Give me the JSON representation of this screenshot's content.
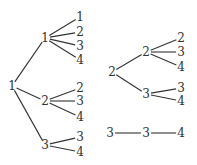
{
  "top_text": "",
  "trees": [
    {
      "label": "1",
      "pos": [
        12,
        86
      ],
      "children": [
        {
          "label": "1",
          "pos": [
            45,
            38
          ],
          "leaves": [
            {
              "label": "1",
              "pos": [
                80,
                17
              ]
            },
            {
              "label": "2",
              "pos": [
                80,
                32
              ]
            },
            {
              "label": "3",
              "pos": [
                80,
                46
              ]
            },
            {
              "label": "4",
              "pos": [
                80,
                60
              ]
            }
          ]
        },
        {
          "label": "2",
          "pos": [
            45,
            101
          ],
          "leaves": [
            {
              "label": "2",
              "pos": [
                80,
                88
              ]
            },
            {
              "label": "3",
              "pos": [
                80,
                101
              ]
            },
            {
              "label": "4",
              "pos": [
                80,
                117
              ]
            }
          ]
        },
        {
          "label": "3",
          "pos": [
            45,
            145
          ],
          "leaves": [
            {
              "label": "3",
              "pos": [
                80,
                137
              ]
            },
            {
              "label": "4",
              "pos": [
                80,
                152
              ]
            }
          ]
        }
      ]
    },
    {
      "label": "2",
      "pos": [
        112,
        72
      ],
      "children": [
        {
          "label": "2",
          "pos": [
            146,
            52
          ],
          "leaves": [
            {
              "label": "2",
              "pos": [
                181,
                38
              ]
            },
            {
              "label": "3",
              "pos": [
                181,
                52
              ]
            },
            {
              "label": "4",
              "pos": [
                181,
                67
              ]
            }
          ]
        },
        {
          "label": "3",
          "pos": [
            146,
            94
          ],
          "leaves": [
            {
              "label": "3",
              "pos": [
                181,
                88
              ]
            },
            {
              "label": "4",
              "pos": [
                181,
                101
              ]
            }
          ]
        }
      ]
    },
    {
      "label": "3",
      "pos": [
        110,
        133
      ],
      "children": [
        {
          "label": "3",
          "pos": [
            146,
            133
          ],
          "leaves": [
            {
              "label": "4",
              "pos": [
                181,
                133
              ]
            }
          ]
        }
      ]
    }
  ]
}
